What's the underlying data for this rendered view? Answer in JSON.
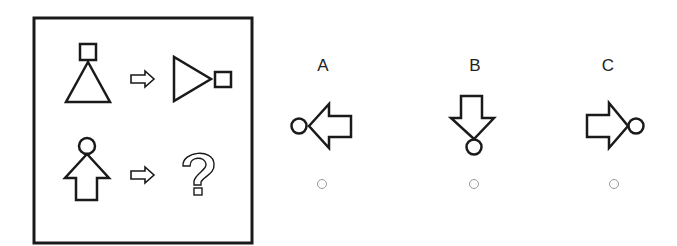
{
  "puzzle": {
    "question_box": {
      "row1": {
        "source": "triangle-with-square-on-top",
        "result": "triangle-rotated-right-with-square"
      },
      "row2": {
        "source": "up-arrow-with-circle-on-top",
        "result": "?"
      }
    },
    "options": [
      {
        "label": "A",
        "figure": "left-arrow-with-circle"
      },
      {
        "label": "B",
        "figure": "down-arrow-with-circle"
      },
      {
        "label": "C",
        "figure": "right-arrow-with-circle"
      }
    ],
    "colors": {
      "stroke": "#1a1a1a",
      "radio": "#999999"
    }
  }
}
